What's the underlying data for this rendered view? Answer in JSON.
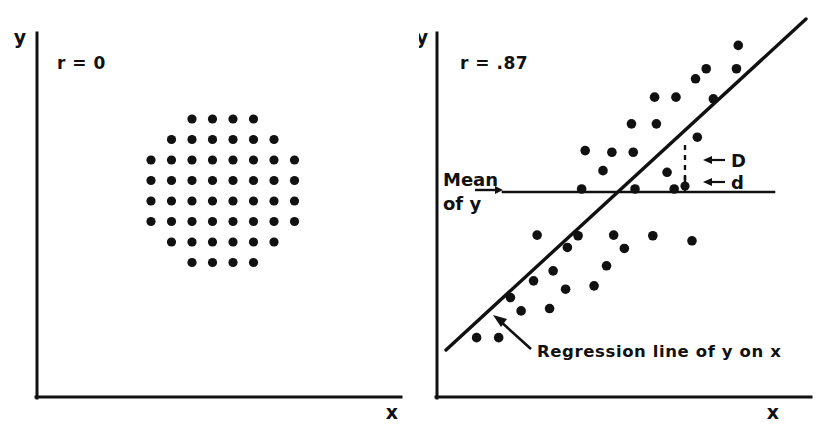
{
  "figure": {
    "width": 838,
    "height": 439,
    "background": "#ffffff",
    "ink_color": "#111111"
  },
  "panels": [
    {
      "id": "left",
      "correlation_label": "r = 0",
      "x_axis_label": "x",
      "y_axis_label": "y"
    },
    {
      "id": "right",
      "correlation_label": "r = .87",
      "x_axis_label": "x",
      "y_axis_label": "y",
      "mean_label_line1": "Mean",
      "mean_label_line2": "of  y",
      "deviation_total_label": "D",
      "deviation_residual_label": "d",
      "arrow_glyph": "←",
      "regression_caption": "Regression line of  y  on  x"
    }
  ],
  "chart_data": [
    {
      "type": "scatter",
      "title": "r = 0",
      "xlabel": "x",
      "ylabel": "y",
      "grid": false,
      "legend": null,
      "xlim": [
        0,
        10
      ],
      "ylim": [
        0,
        10
      ],
      "annotations": [
        {
          "text": "r = 0",
          "x": 0.6,
          "y": 9.2
        }
      ],
      "points": [
        {
          "x": 4.0,
          "y": 8.0
        },
        {
          "x": 5.0,
          "y": 8.0
        },
        {
          "x": 6.0,
          "y": 8.0
        },
        {
          "x": 7.0,
          "y": 8.0
        },
        {
          "x": 3.0,
          "y": 7.0
        },
        {
          "x": 4.0,
          "y": 7.0
        },
        {
          "x": 5.0,
          "y": 7.0
        },
        {
          "x": 6.0,
          "y": 7.0
        },
        {
          "x": 7.0,
          "y": 7.0
        },
        {
          "x": 8.0,
          "y": 7.0
        },
        {
          "x": 2.0,
          "y": 6.0
        },
        {
          "x": 3.0,
          "y": 6.0
        },
        {
          "x": 4.0,
          "y": 6.0
        },
        {
          "x": 5.0,
          "y": 6.0
        },
        {
          "x": 6.0,
          "y": 6.0
        },
        {
          "x": 7.0,
          "y": 6.0
        },
        {
          "x": 8.0,
          "y": 6.0
        },
        {
          "x": 9.0,
          "y": 6.0
        },
        {
          "x": 2.0,
          "y": 5.0
        },
        {
          "x": 3.0,
          "y": 5.0
        },
        {
          "x": 4.0,
          "y": 5.0
        },
        {
          "x": 5.0,
          "y": 5.0
        },
        {
          "x": 6.0,
          "y": 5.0
        },
        {
          "x": 7.0,
          "y": 5.0
        },
        {
          "x": 8.0,
          "y": 5.0
        },
        {
          "x": 9.0,
          "y": 5.0
        },
        {
          "x": 2.0,
          "y": 4.0
        },
        {
          "x": 3.0,
          "y": 4.0
        },
        {
          "x": 4.0,
          "y": 4.0
        },
        {
          "x": 5.0,
          "y": 4.0
        },
        {
          "x": 6.0,
          "y": 4.0
        },
        {
          "x": 7.0,
          "y": 4.0
        },
        {
          "x": 8.0,
          "y": 4.0
        },
        {
          "x": 9.0,
          "y": 4.0
        },
        {
          "x": 2.0,
          "y": 3.0
        },
        {
          "x": 3.0,
          "y": 3.0
        },
        {
          "x": 4.0,
          "y": 3.0
        },
        {
          "x": 5.0,
          "y": 3.0
        },
        {
          "x": 6.0,
          "y": 3.0
        },
        {
          "x": 7.0,
          "y": 3.0
        },
        {
          "x": 8.0,
          "y": 3.0
        },
        {
          "x": 9.0,
          "y": 3.0
        },
        {
          "x": 3.0,
          "y": 2.0
        },
        {
          "x": 4.0,
          "y": 2.0
        },
        {
          "x": 5.0,
          "y": 2.0
        },
        {
          "x": 6.0,
          "y": 2.0
        },
        {
          "x": 7.0,
          "y": 2.0
        },
        {
          "x": 8.0,
          "y": 2.0
        },
        {
          "x": 4.0,
          "y": 1.0
        },
        {
          "x": 5.0,
          "y": 1.0
        },
        {
          "x": 6.0,
          "y": 1.0
        },
        {
          "x": 7.0,
          "y": 1.0
        }
      ],
      "description": "Circular cloud of evenly spaced dots showing no correlation."
    },
    {
      "type": "scatter",
      "title": "r = .87",
      "xlabel": "x",
      "ylabel": "y",
      "grid": false,
      "legend": null,
      "xlim": [
        0,
        10
      ],
      "ylim": [
        0,
        10
      ],
      "annotations": [
        {
          "text": "r = .87",
          "x": 0.55,
          "y": 9.3
        },
        {
          "text": "Mean of y",
          "x": 0.1,
          "y": 5.0
        },
        {
          "text": "D",
          "x": 7.3,
          "y": 6.3
        },
        {
          "text": "d",
          "x": 7.3,
          "y": 5.45
        },
        {
          "text": "Regression line of y on x",
          "x": 2.6,
          "y": 0.85
        }
      ],
      "points": [
        {
          "x": 1.0,
          "y": 0.55
        },
        {
          "x": 1.62,
          "y": 0.55
        },
        {
          "x": 2.25,
          "y": 1.35
        },
        {
          "x": 1.95,
          "y": 1.75
        },
        {
          "x": 3.05,
          "y": 1.42
        },
        {
          "x": 2.6,
          "y": 2.25
        },
        {
          "x": 3.5,
          "y": 2.0
        },
        {
          "x": 3.15,
          "y": 2.55
        },
        {
          "x": 4.3,
          "y": 2.1
        },
        {
          "x": 4.65,
          "y": 2.7
        },
        {
          "x": 3.55,
          "y": 3.25
        },
        {
          "x": 5.15,
          "y": 3.22
        },
        {
          "x": 2.7,
          "y": 3.62
        },
        {
          "x": 3.85,
          "y": 3.6
        },
        {
          "x": 4.85,
          "y": 3.62
        },
        {
          "x": 5.95,
          "y": 3.6
        },
        {
          "x": 7.05,
          "y": 3.45
        },
        {
          "x": 3.95,
          "y": 5.0
        },
        {
          "x": 5.45,
          "y": 5.0
        },
        {
          "x": 6.55,
          "y": 5.0
        },
        {
          "x": 4.55,
          "y": 5.55
        },
        {
          "x": 6.35,
          "y": 5.5
        },
        {
          "x": 4.05,
          "y": 6.15
        },
        {
          "x": 4.8,
          "y": 6.1
        },
        {
          "x": 5.4,
          "y": 6.1
        },
        {
          "x": 7.2,
          "y": 6.55
        },
        {
          "x": 5.35,
          "y": 6.95
        },
        {
          "x": 6.05,
          "y": 6.95
        },
        {
          "x": 6.0,
          "y": 7.75
        },
        {
          "x": 6.6,
          "y": 7.75
        },
        {
          "x": 7.65,
          "y": 7.7
        },
        {
          "x": 7.15,
          "y": 8.3
        },
        {
          "x": 7.45,
          "y": 8.6
        },
        {
          "x": 8.3,
          "y": 8.6
        },
        {
          "x": 8.35,
          "y": 9.3
        }
      ],
      "regression_line": {
        "label": "Regression line of y on x",
        "x_start": 0.85,
        "y_start": 0.85,
        "x_end": 8.85,
        "y_end": 9.6,
        "slope": 1.09,
        "r": 0.87
      },
      "mean_line": {
        "label": "Mean of y",
        "y_value": 5.0,
        "style": "solid"
      },
      "deviation_markers": {
        "x_at": 6.95,
        "total_D": {
          "from_y": 5.0,
          "to_y": 6.55,
          "label": "D",
          "style": "dashed"
        },
        "residual_d": {
          "from_y": 4.65,
          "to_y": 5.0,
          "label": "d",
          "style": "solid"
        }
      },
      "description": "Positively correlated scatter with fitted regression line, horizontal mean-of-y line, and D / d deviation brackets."
    }
  ]
}
